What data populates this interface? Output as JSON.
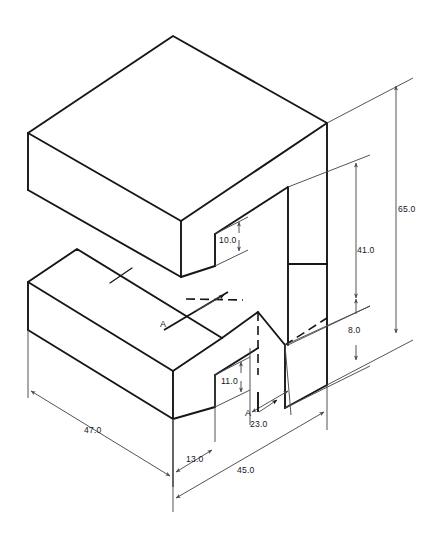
{
  "drawing": {
    "type": "isometric-technical-drawing",
    "title": "Isometric view of stepped block with slot",
    "units": "mm",
    "background_color": "#ffffff",
    "line_color": "#16161a",
    "dimension_color": "#4a4a50"
  },
  "dimensions": [
    {
      "id": "height-overall",
      "value": "65.0",
      "orientation": "vertical",
      "location": "far-right",
      "x": 398,
      "y": 209
    },
    {
      "id": "height-upper-step",
      "value": "41.0",
      "orientation": "vertical",
      "location": "right-inner",
      "x": 355,
      "y": 250
    },
    {
      "id": "height-lower-gap",
      "value": "8.0",
      "orientation": "vertical",
      "location": "right-lower",
      "x": 355,
      "y": 330
    },
    {
      "id": "notch-depth-upper",
      "value": "10.0",
      "orientation": "vertical",
      "location": "center-upper-notch",
      "x": 228,
      "y": 245
    },
    {
      "id": "notch-depth-lower",
      "value": "11.0",
      "orientation": "vertical",
      "location": "center-lower-notch",
      "x": 231,
      "y": 353
    },
    {
      "id": "length-left-block",
      "value": "47.0",
      "orientation": "iso-left",
      "location": "bottom-left",
      "x": 89,
      "y": 430
    },
    {
      "id": "slot-width",
      "value": "13.0",
      "orientation": "iso-right",
      "location": "bottom-center",
      "x": 194,
      "y": 459
    },
    {
      "id": "depth-right-face",
      "value": "23.0",
      "orientation": "iso-right",
      "location": "bottom-right",
      "x": 258,
      "y": 424
    },
    {
      "id": "depth-overall",
      "value": "45.0",
      "orientation": "iso-right",
      "location": "bottom-outer",
      "x": 247,
      "y": 470
    }
  ],
  "section_markers": [
    {
      "id": "section-a-upper",
      "label": "A",
      "x": 164,
      "y": 324
    },
    {
      "id": "section-a-lower",
      "label": "A",
      "x": 249,
      "y": 414
    }
  ]
}
